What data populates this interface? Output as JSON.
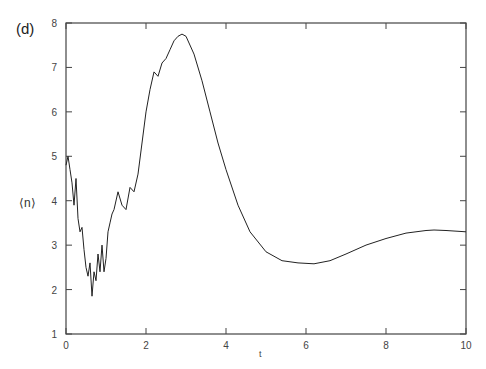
{
  "panel_label": "(d)",
  "chart_data": {
    "type": "line",
    "title": "",
    "xlabel": "t",
    "ylabel": "⟨n⟩",
    "xlim": [
      0,
      10
    ],
    "ylim": [
      1,
      8
    ],
    "xticks": [
      0,
      2,
      4,
      6,
      8,
      10
    ],
    "yticks": [
      1,
      2,
      3,
      4,
      5,
      6,
      7,
      8
    ],
    "grid": false,
    "legend": null,
    "series": [
      {
        "name": "<n>(t)",
        "x": [
          0.0,
          0.05,
          0.1,
          0.15,
          0.2,
          0.25,
          0.3,
          0.35,
          0.4,
          0.45,
          0.5,
          0.55,
          0.6,
          0.65,
          0.7,
          0.75,
          0.8,
          0.85,
          0.9,
          0.95,
          1.0,
          1.05,
          1.1,
          1.15,
          1.2,
          1.3,
          1.4,
          1.5,
          1.6,
          1.7,
          1.8,
          1.9,
          2.0,
          2.1,
          2.2,
          2.3,
          2.4,
          2.5,
          2.6,
          2.7,
          2.8,
          2.9,
          3.0,
          3.2,
          3.4,
          3.6,
          3.8,
          4.0,
          4.3,
          4.6,
          5.0,
          5.4,
          5.8,
          6.2,
          6.6,
          7.0,
          7.5,
          8.0,
          8.5,
          9.0,
          9.2,
          9.5,
          10.0
        ],
        "y": [
          4.8,
          5.0,
          4.7,
          4.4,
          3.9,
          4.5,
          3.6,
          3.3,
          3.4,
          2.9,
          2.5,
          2.3,
          2.6,
          1.85,
          2.4,
          2.2,
          2.8,
          2.4,
          3.0,
          2.4,
          2.7,
          3.3,
          3.5,
          3.7,
          3.8,
          4.2,
          3.9,
          3.8,
          4.3,
          4.2,
          4.6,
          5.3,
          6.0,
          6.5,
          6.9,
          6.8,
          7.1,
          7.2,
          7.4,
          7.6,
          7.7,
          7.75,
          7.7,
          7.3,
          6.7,
          6.0,
          5.3,
          4.7,
          3.9,
          3.3,
          2.85,
          2.65,
          2.6,
          2.58,
          2.65,
          2.8,
          3.0,
          3.15,
          3.27,
          3.33,
          3.34,
          3.33,
          3.3
        ]
      }
    ]
  }
}
